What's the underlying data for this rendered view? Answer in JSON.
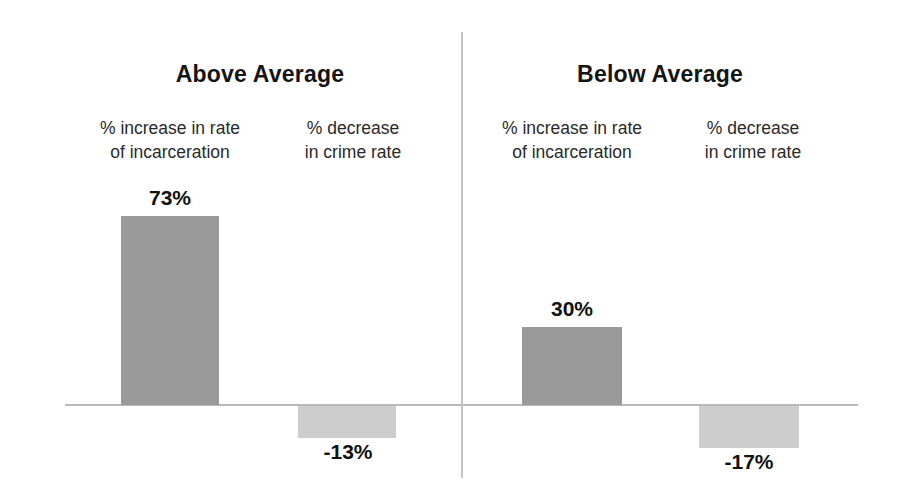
{
  "chart_data": {
    "type": "bar",
    "title": "",
    "xlabel": "",
    "ylabel": "",
    "grid": false,
    "legend": "none",
    "baseline_value": 0,
    "panels": [
      {
        "name": "Above Average",
        "categories": [
          "% increase in rate\nof incarceration",
          "% decrease\nin crime rate"
        ],
        "values": [
          73,
          -13
        ],
        "value_labels": [
          "73%",
          "-13%"
        ]
      },
      {
        "name": "Below Average",
        "categories": [
          "% increase in rate\nof incarceration",
          "% decrease\nin crime rate"
        ],
        "values": [
          30,
          -17
        ],
        "value_labels": [
          "30%",
          "-17%"
        ]
      }
    ],
    "colors": {
      "incarceration_bar": "#9a9a9a",
      "crime_bar": "#cdcdcd",
      "axis_line": "#b9b9b9",
      "divider_line": "#c4c4c4",
      "background": "#ffffff",
      "text": "#111111"
    }
  }
}
